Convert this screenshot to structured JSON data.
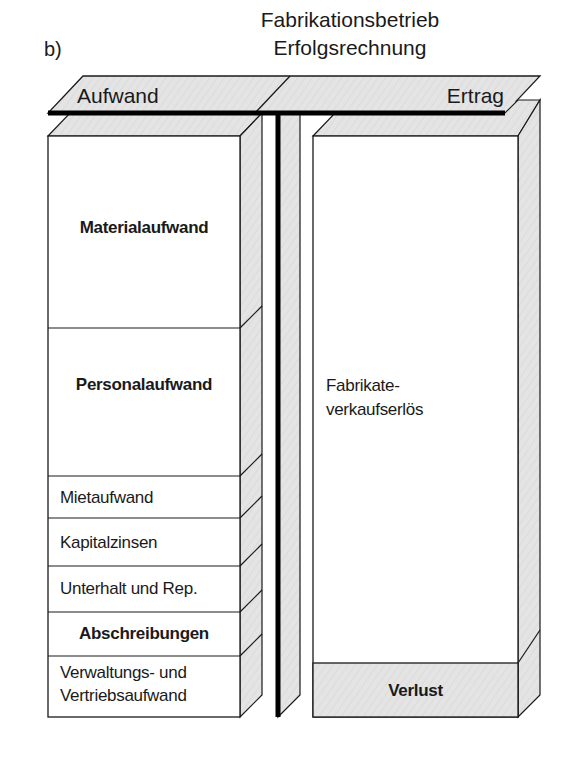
{
  "figure": {
    "label": "b)",
    "title_line1": "Fabrikationsbetrieb",
    "title_line2": "Erfolgsrechnung"
  },
  "account": {
    "left_header": "Aufwand",
    "right_header": "Ertrag"
  },
  "aufwand_items": [
    {
      "label": "Materialaufwand",
      "bold": true
    },
    {
      "label": "Personalaufwand",
      "bold": true
    },
    {
      "label": "Mietaufwand",
      "bold": false
    },
    {
      "label": "Kapitalzinsen",
      "bold": false
    },
    {
      "label": "Unterhalt und Rep.",
      "bold": false
    },
    {
      "label": "Abschreibungen",
      "bold": true
    },
    {
      "label_line1": "Verwaltungs- und",
      "label_line2": "Vertriebsaufwand",
      "bold": false
    }
  ],
  "ertrag_items": [
    {
      "label_line1": "Fabrikate-",
      "label_line2": "verkaufserlös",
      "bold": false
    },
    {
      "label": "Verlust",
      "bold": true,
      "shaded": true
    }
  ],
  "colors": {
    "face": "#ffffff",
    "shade": "#e3e3e3",
    "stroke": "#1a1a1a",
    "t_account_line": "#000000"
  }
}
